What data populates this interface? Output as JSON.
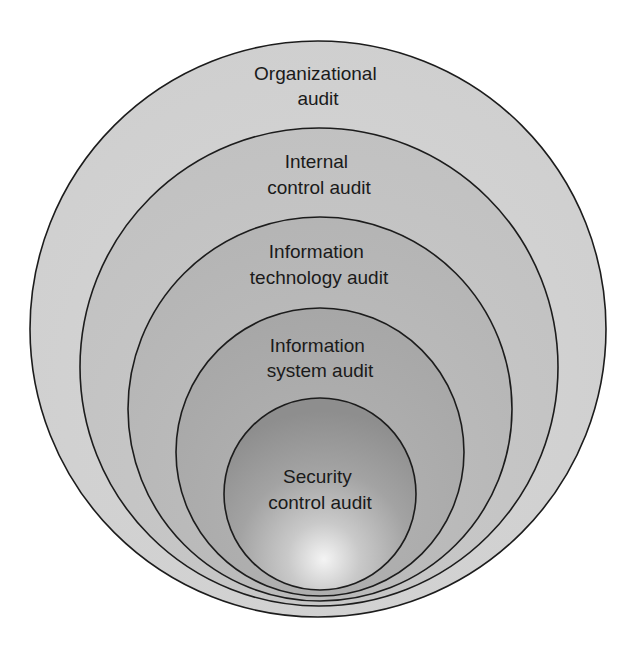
{
  "diagram": {
    "type": "nested-circles",
    "title": "",
    "layers": [
      {
        "id": "organizational",
        "label_lines": [
          "Organizational",
          "audit"
        ],
        "fill": "#d2d2d2",
        "circle": {
          "cx": 318,
          "cy": 329,
          "r": 288
        },
        "label_baselines": [
          80,
          105
        ]
      },
      {
        "id": "internal-control",
        "label_lines": [
          "Internal",
          "control audit"
        ],
        "fill": "#c5c5c5",
        "circle": {
          "cx": 319,
          "cy": 367,
          "r": 239
        },
        "label_baselines": [
          168,
          194
        ]
      },
      {
        "id": "information-technology",
        "label_lines": [
          "Information",
          "technology audit"
        ],
        "fill": "#b9b9b9",
        "circle": {
          "cx": 320,
          "cy": 409,
          "r": 192
        },
        "label_baselines": [
          258,
          284
        ]
      },
      {
        "id": "information-system",
        "label_lines": [
          "Information",
          "system audit"
        ],
        "fill": "#acacac",
        "circle": {
          "cx": 320,
          "cy": 452,
          "r": 144
        },
        "label_baselines": [
          352,
          377
        ]
      },
      {
        "id": "security-control",
        "label_lines": [
          "Security",
          "control audit"
        ],
        "fill": "#9a9a9a",
        "highlight": "#f2f2f2",
        "circle": {
          "cx": 320,
          "cy": 494,
          "r": 96
        },
        "label_baselines": [
          483,
          509
        ]
      }
    ]
  }
}
